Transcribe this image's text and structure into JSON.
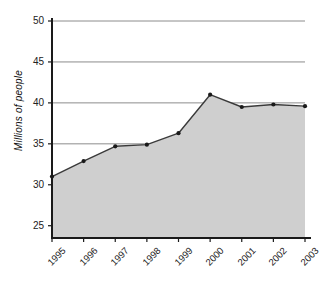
{
  "chart_data": {
    "type": "area",
    "title": "",
    "subtitle": "",
    "xlabel": "",
    "ylabel": "Millions of people",
    "categories": [
      "1995",
      "1996",
      "1997",
      "1998",
      "1999",
      "2000",
      "2001",
      "2002",
      "2003"
    ],
    "values": [
      31.0,
      32.9,
      34.7,
      34.9,
      36.3,
      41.0,
      39.5,
      39.8,
      39.6
    ],
    "series": [
      {
        "name": "Millions of people",
        "values": [
          31.0,
          32.9,
          34.7,
          34.9,
          36.3,
          41.0,
          39.5,
          39.8,
          39.6
        ]
      }
    ],
    "ylim": [
      23.5,
      50
    ],
    "yticks": [
      25,
      30,
      35,
      40,
      45,
      50
    ],
    "ytick_labels": [
      "25",
      "30",
      "35",
      "40",
      "45",
      "50"
    ],
    "xtick_labels": [
      "1995",
      "1996",
      "1997",
      "1998",
      "1999",
      "2000",
      "2001",
      "2002",
      "2003"
    ],
    "grid": "horizontal",
    "legend": "none",
    "colors": {
      "fill": "#cfcfcf",
      "line": "#3a3a3a",
      "marker": "#1a1a1a",
      "grid": "#8c8c8c",
      "axis": "#1a1a1a",
      "background": "#ffffff",
      "text": "#222222"
    },
    "marker_style": "circle",
    "line_width": 1.4
  }
}
